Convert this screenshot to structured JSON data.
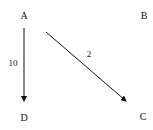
{
  "diagram": {
    "nodes": [
      {
        "id": "A",
        "label": "A",
        "x": 24,
        "y": 16
      },
      {
        "id": "B",
        "label": "B",
        "x": 144,
        "y": 16
      },
      {
        "id": "C",
        "label": "C",
        "x": 143,
        "y": 117
      },
      {
        "id": "D",
        "label": "D",
        "x": 24,
        "y": 118
      }
    ],
    "edges": [
      {
        "from": "A",
        "to": "D",
        "label": "10",
        "x1": 24,
        "y1": 28,
        "x2": 24,
        "y2": 101,
        "lx": 13,
        "ly": 63
      },
      {
        "from": "A",
        "to": "C",
        "label": "2",
        "x1": 46,
        "y1": 32,
        "x2": 126,
        "y2": 101,
        "lx": 89,
        "ly": 54
      }
    ],
    "colors": {
      "stroke": "#111111",
      "background": "#ffffff"
    }
  }
}
